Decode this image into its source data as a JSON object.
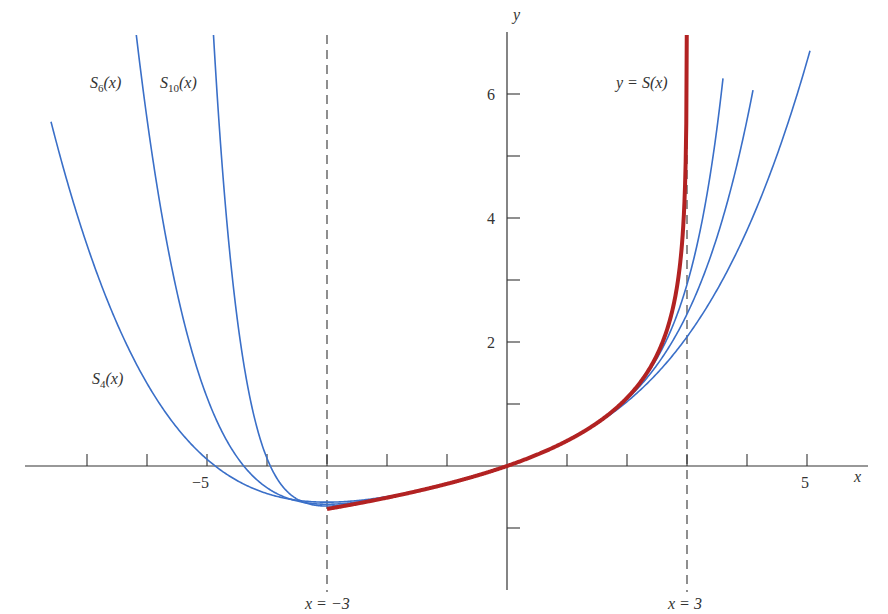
{
  "chart_data": {
    "type": "line",
    "title": "",
    "xlabel": "x",
    "ylabel": "y",
    "xlim": [
      -8.0,
      6.05
    ],
    "ylim": [
      -2.0,
      7.0
    ],
    "grid": false,
    "legend": "inline labels",
    "x_ticks": [
      -7,
      -6,
      -5,
      -4,
      -3,
      -2,
      -1,
      1,
      2,
      3,
      4,
      5
    ],
    "x_tick_labels": [
      {
        "value": -5,
        "label": "−5"
      },
      {
        "value": 5,
        "label": "5"
      }
    ],
    "y_ticks": [
      -1,
      1,
      2,
      3,
      4,
      5,
      6
    ],
    "y_tick_labels": [
      {
        "value": 2,
        "label": "2"
      },
      {
        "value": 4,
        "label": "4"
      },
      {
        "value": 6,
        "label": "6"
      }
    ],
    "asymptotes": [
      {
        "x": -3,
        "label": "x = −3",
        "style": "dashed"
      },
      {
        "x": 3,
        "label": "x = 3",
        "style": "dashed"
      }
    ],
    "function": "S(x) = -ln(1 - x/3) = Σ x^n / (n·3^n)",
    "series": [
      {
        "name": "y = S(x)",
        "label": "y = S(x)",
        "color": "#b22222",
        "width": 4,
        "x_range": [
          -3,
          2.998
        ],
        "kind": "exact"
      },
      {
        "name": "S4(x)",
        "label_main": "S",
        "label_sub": "4",
        "label_tail": "(x)",
        "color": "#3a6fc8",
        "width": 1.6,
        "degree": 4,
        "x_range": [
          -7.6,
          5.05
        ]
      },
      {
        "name": "S6(x)",
        "label_main": "S",
        "label_sub": "6",
        "label_tail": "(x)",
        "color": "#3a6fc8",
        "width": 1.6,
        "degree": 6,
        "x_range": [
          -6.4,
          4.1
        ]
      },
      {
        "name": "S10(x)",
        "label_main": "S",
        "label_sub": "10",
        "label_tail": "(x)",
        "color": "#3a6fc8",
        "width": 1.6,
        "degree": 10,
        "x_range": [
          -5.2,
          3.6
        ]
      }
    ],
    "sample_values": {
      "S(-3)": -0.693,
      "S(0)": 0,
      "S(1)": 0.405,
      "S(2)": 1.099,
      "S4(3)": 2.083,
      "S6(3)": 2.45,
      "S10(3)": 2.929,
      "S4(-7.5)": 5.18
    }
  },
  "labels": {
    "y_axis": "y",
    "x_axis": "x",
    "s_curve": "y = S(x)",
    "asym_left": "x = −3",
    "asym_right": "x = 3",
    "tick_m5": "−5",
    "tick_5": "5",
    "tick_2": "2",
    "tick_4": "4",
    "tick_6": "6"
  }
}
